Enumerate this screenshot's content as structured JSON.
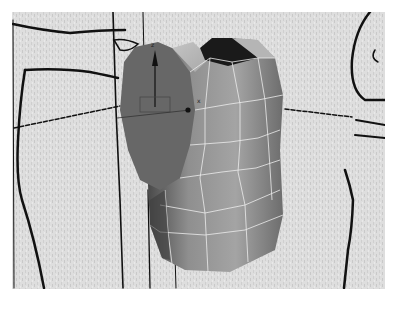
{
  "viewport": {
    "view": "perspective",
    "background_color": "#dcdcdc",
    "mesh_color": "#8e8e8e",
    "mesh_dark": "#5c5c5c",
    "selected_face_color": "#666666",
    "wire_color": "#e8e8e8",
    "sketch_line_color": "#111111"
  },
  "gizmo": {
    "z_label": "z",
    "x_label": "x"
  }
}
